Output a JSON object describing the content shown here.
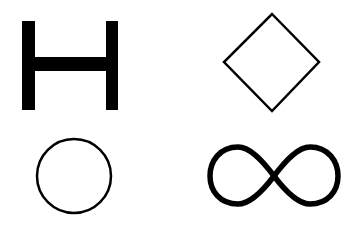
{
  "canvas": {
    "width": 358,
    "height": 229,
    "background": "#ffffff"
  },
  "shapes": [
    {
      "name": "h-shape",
      "kind": "letter-H",
      "color": "#000000",
      "style": "filled"
    },
    {
      "name": "diamond",
      "kind": "diamond",
      "color": "#000000",
      "style": "outline"
    },
    {
      "name": "circle",
      "kind": "circle",
      "color": "#000000",
      "style": "outline"
    },
    {
      "name": "infinity",
      "kind": "infinity",
      "color": "#000000",
      "style": "outline"
    }
  ]
}
